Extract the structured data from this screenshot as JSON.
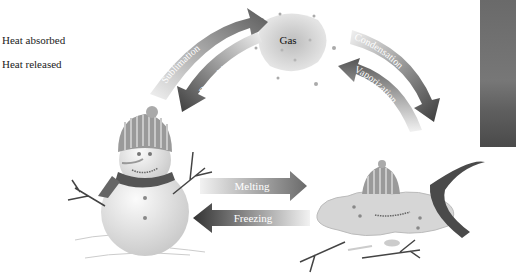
{
  "legend": {
    "heat_absorbed": "Heat absorbed",
    "heat_released": "Heat released"
  },
  "states": {
    "gas": "Gas"
  },
  "processes": {
    "sublimation": "Sublimation",
    "deposition": "Deposition",
    "condensation": "Condensation",
    "vaporization": "Vaporization",
    "melting": "Melting",
    "freezing": "Freezing"
  },
  "colors": {
    "arrow_dark": "#4a4a4a",
    "arrow_light": "#e6e6e6",
    "gas_cloud": "#cfcfcf",
    "snow": "#e8e8e8"
  }
}
